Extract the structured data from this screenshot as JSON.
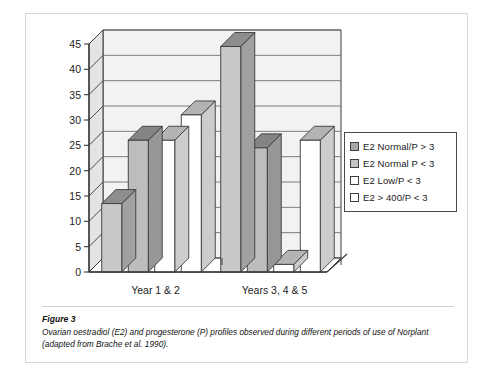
{
  "figure": {
    "caption_title": "Figure 3",
    "caption_text": "Ovarian oestradiol (E2) and progesterone (P) profiles observed during different periods of use of Norplant (adapted from Brache et al. 1990)."
  },
  "legend": {
    "items": [
      {
        "label": "E2 Normal/P > 3",
        "swatch_color": "#a8a8a8"
      },
      {
        "label": "E2 Normal P < 3",
        "swatch_color": "#c4c4c4"
      },
      {
        "label": "E2 Low/P < 3",
        "swatch_color": "#ffffff"
      },
      {
        "label": "E2 > 400/P < 3",
        "swatch_color": "#ffffff"
      }
    ]
  },
  "chart_data": {
    "type": "bar",
    "title": "",
    "subtitle": "",
    "xlabel": "",
    "ylabel": "",
    "categories": [
      "Year 1 & 2",
      "Years 3, 4 & 5"
    ],
    "series": [
      {
        "name": "E2 Normal/P > 3",
        "values": [
          13.5,
          44.5
        ],
        "color": "#c9c9c9"
      },
      {
        "name": "E2 Normal P < 3",
        "values": [
          26.0,
          24.5
        ],
        "color": "#bdbdbd"
      },
      {
        "name": "E2 Low/P < 3",
        "values": [
          26.0,
          1.5
        ],
        "color": "#ffffff"
      },
      {
        "name": "E2 > 400/P < 3",
        "values": [
          31.0,
          26.0
        ],
        "color": "#ffffff"
      }
    ],
    "ylim": [
      0,
      45
    ],
    "ytick_labels": [
      "0",
      "5",
      "10",
      "15",
      "20",
      "25",
      "30",
      "35",
      "40",
      "45"
    ],
    "ytick_values": [
      0,
      5,
      10,
      15,
      20,
      25,
      30,
      35,
      40,
      45
    ],
    "grid": true,
    "legend_position": "right",
    "three_d": true,
    "plot_background": "#f2f2f2"
  },
  "colors": {
    "panel_border": "#d6d6d6",
    "axis_line": "#3a3a3a",
    "grid_line": "#6e6e6e",
    "bar_outline": "#3a3a3a",
    "text": "#1a1a1a"
  }
}
